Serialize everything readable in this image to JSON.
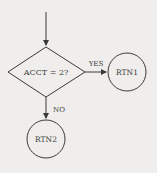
{
  "diagram": {
    "decision": {
      "label": "ACCT = 2?"
    },
    "yes_branch": {
      "label": "YES",
      "target": "RTN1"
    },
    "no_branch": {
      "label": "NO",
      "target": "RTN2"
    },
    "nodes": [
      {
        "id": "rtn1",
        "label": "RTN1"
      },
      {
        "id": "rtn2",
        "label": "RTN2"
      }
    ],
    "colors": {
      "background": "#efeeec",
      "stroke": "#3a3a3a"
    }
  }
}
